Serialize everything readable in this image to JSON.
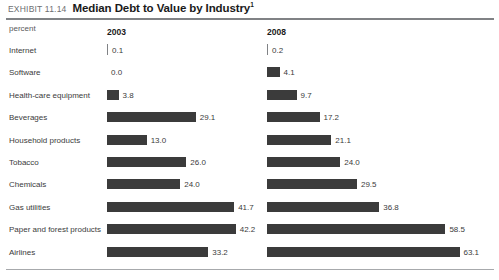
{
  "header": {
    "kicker": "EXHIBIT 11.14",
    "title": "Median Debt to Value by Industry",
    "footnote_marker": "1"
  },
  "units_label": "percent",
  "chart_data": {
    "type": "bar",
    "title": "Median Debt to Value by Industry",
    "xlabel": "",
    "ylabel": "",
    "unit": "percent",
    "orientation": "horizontal",
    "grid": false,
    "legend": "none",
    "axis_max": 63.1,
    "categories": [
      "Internet",
      "Software",
      "Health-care equipment",
      "Beverages",
      "Household products",
      "Tobacco",
      "Chemicals",
      "Gas utilities",
      "Paper and forest products",
      "Airlines"
    ],
    "series": [
      {
        "name": "2003",
        "values": [
          0.1,
          0.0,
          3.8,
          29.1,
          13.0,
          26.0,
          24.0,
          41.7,
          42.2,
          33.2
        ],
        "labels": [
          "0.1",
          "0.0",
          "3.8",
          "29.1",
          "13.0",
          "26.0",
          "24.0",
          "41.7",
          "42.2",
          "33.2"
        ]
      },
      {
        "name": "2008",
        "values": [
          0.2,
          4.1,
          9.7,
          17.2,
          21.1,
          24.0,
          29.5,
          36.8,
          58.5,
          63.1
        ],
        "labels": [
          "0.2",
          "4.1",
          "9.7",
          "17.2",
          "21.1",
          "24.0",
          "29.5",
          "36.8",
          "58.5",
          "63.1"
        ]
      }
    ],
    "bar_color": "#3b3b3b",
    "rule_color": "#808285"
  }
}
